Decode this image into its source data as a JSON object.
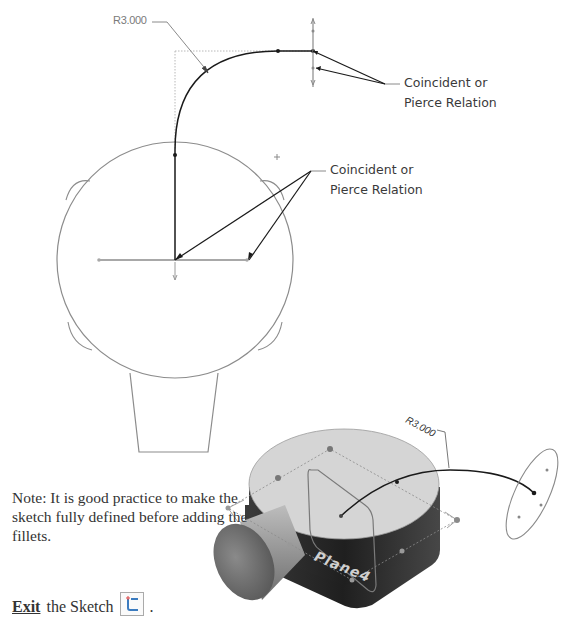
{
  "top_view": {
    "dimension_label": "R3.000",
    "callout_top": {
      "line1": "Coincident or",
      "line2": "Pierce Relation"
    },
    "callout_middle": {
      "line1": "Coincident or",
      "line2": "Pierce Relation"
    }
  },
  "iso_view": {
    "dimension_label": "R3.000",
    "plane_label": "Plane4"
  },
  "note": {
    "text": "Note: It is good practice to make the sketch fully defined before adding the fillets."
  },
  "exit": {
    "action_word": "Exit",
    "rest": "the Sketch",
    "icon": "exit-sketch-icon",
    "trailing": "."
  },
  "colors": {
    "sketch_line": "#1a1a1a",
    "construction_line": "#9a9a9a",
    "model_top_face": "#d6d6d6",
    "model_side": "#2e2e2e"
  }
}
